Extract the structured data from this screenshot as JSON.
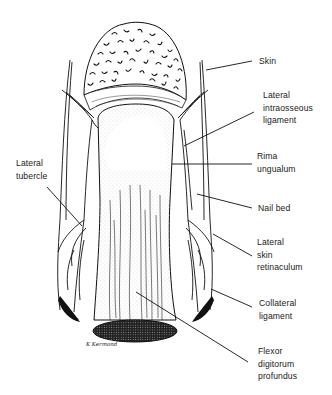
{
  "figure": {
    "signature": "K Kermond",
    "labels": [
      {
        "id": "skin",
        "text": "Skin",
        "x": 259,
        "y": 55,
        "line": [
          [
            206,
            70
          ],
          [
            252,
            61
          ]
        ]
      },
      {
        "id": "lateral-intraosseous-ligament",
        "text": "Lateral\nintraosseous\nligament",
        "x": 263,
        "y": 89,
        "line": [
          [
            184,
            146
          ],
          [
            254,
            112
          ]
        ]
      },
      {
        "id": "rima-ungualum",
        "text": "Rima\nungualum",
        "x": 257,
        "y": 150,
        "line": [
          [
            172,
            164
          ],
          [
            252,
            164
          ]
        ]
      },
      {
        "id": "nail-bed",
        "text": "Nail bed",
        "x": 258,
        "y": 202,
        "line": [
          [
            197,
            194
          ],
          [
            252,
            208
          ]
        ]
      },
      {
        "id": "lateral-skin-retinaculum",
        "text": "Lateral\nskin\nretinaculum",
        "x": 257,
        "y": 236,
        "line": [
          [
            213,
            234
          ],
          [
            252,
            256
          ]
        ]
      },
      {
        "id": "collateral-ligament",
        "text": "Collateral\nligament",
        "x": 259,
        "y": 297,
        "line": [
          [
            211,
            289
          ],
          [
            252,
            307
          ]
        ]
      },
      {
        "id": "flexor-digitorum-profundus",
        "text": "Flexor\ndigitorum\nprofundus",
        "x": 258,
        "y": 345,
        "line": [
          [
            136,
            292
          ],
          [
            248,
            362
          ]
        ]
      },
      {
        "id": "lateral-tubercle",
        "text": "Lateral\ntubercle",
        "x": 16,
        "y": 157,
        "line": [
          [
            47,
            187
          ],
          [
            82,
            226
          ]
        ]
      }
    ]
  }
}
